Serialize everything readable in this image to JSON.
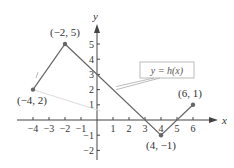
{
  "chart_data": {
    "type": "line",
    "title": "",
    "xlabel": "x",
    "ylabel": "y",
    "xlim": [
      -4.5,
      6.8
    ],
    "ylim": [
      -2.5,
      6
    ],
    "grid": false,
    "series": [
      {
        "name": "y = h(x)",
        "x": [
          -4,
          -2,
          4,
          6
        ],
        "y": [
          2,
          5,
          -1,
          1
        ]
      }
    ],
    "x_ticks": [
      -4,
      -3,
      -2,
      -1,
      1,
      2,
      3,
      4,
      5,
      6
    ],
    "x_tick_labels": [
      "−4",
      "−3",
      "−2",
      "−1",
      "1",
      "2",
      "3",
      "4",
      "5",
      "6"
    ],
    "y_ticks": [
      -2,
      -1,
      1,
      2,
      3,
      4,
      5
    ],
    "y_tick_labels": [
      "−2",
      "−1",
      "1",
      "2",
      "3",
      "4",
      "5"
    ],
    "point_labels": [
      {
        "x": -4,
        "y": 2,
        "text": "(−4, 2)"
      },
      {
        "x": -2,
        "y": 5,
        "text": "(−2, 5)"
      },
      {
        "x": 4,
        "y": -1,
        "text": "(4, −1)"
      },
      {
        "x": 6,
        "y": 1,
        "text": "(6, 1)"
      }
    ],
    "annotations": [
      {
        "text": "y = h(x)"
      }
    ]
  }
}
